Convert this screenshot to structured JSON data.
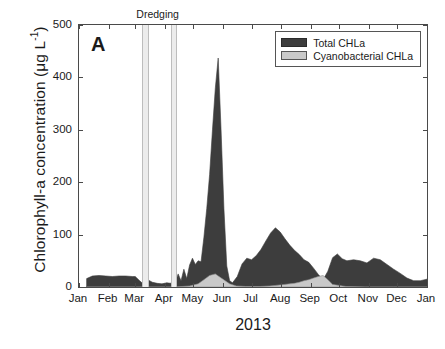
{
  "panel": {
    "letter": "A"
  },
  "annotation": {
    "dredging_label": "Dredging"
  },
  "legend": {
    "items": [
      {
        "label": "Total CHLa",
        "color": "#3d3d3d"
      },
      {
        "label": "Cyanobacterial CHLa",
        "color": "#c9c9c9"
      }
    ]
  },
  "axes": {
    "ylabel_main": "Chlorophyll-a concentration (μg L",
    "ylabel_sup": "-1",
    "ylabel_close": ")",
    "xlabel": "2013",
    "yticks": [
      "0",
      "100",
      "200",
      "300",
      "400",
      "500"
    ],
    "xticks": [
      "Jan",
      "Feb",
      "Mar",
      "Apr",
      "May",
      "Jun",
      "Jul",
      "Aug",
      "Sep",
      "Oct",
      "Nov",
      "Dec",
      "Jan"
    ]
  },
  "chart_data": {
    "type": "area",
    "title": "",
    "xlabel": "2013",
    "ylabel": "Chlorophyll-a concentration (µg L-1)",
    "ylim": [
      0,
      500
    ],
    "xlim": [
      0,
      365
    ],
    "grid": false,
    "legend_position": "top-right",
    "x_tick_labels": [
      "Jan",
      "Feb",
      "Mar",
      "Apr",
      "May",
      "Jun",
      "Jul",
      "Aug",
      "Sep",
      "Oct",
      "Nov",
      "Dec",
      "Jan"
    ],
    "x_tick_days": [
      0,
      31,
      59,
      90,
      120,
      151,
      181,
      212,
      243,
      273,
      304,
      334,
      365
    ],
    "annotations": [
      {
        "text": "Dredging",
        "type": "shaded-bands",
        "band_days": [
          [
            66,
            71
          ],
          [
            96,
            101
          ]
        ]
      },
      {
        "text": "A",
        "type": "panel-label"
      }
    ],
    "series": [
      {
        "name": "Total CHLa",
        "color": "#3d3d3d",
        "x_days": [
          8,
          14,
          21,
          28,
          35,
          42,
          49,
          56,
          59,
          63,
          66,
          68,
          70,
          73,
          77,
          82,
          87,
          92,
          96,
          99,
          101,
          104,
          107,
          110,
          113,
          116,
          119,
          122,
          125,
          128,
          131,
          134,
          137,
          140,
          143,
          146,
          149,
          152,
          155,
          158,
          161,
          166,
          171,
          176,
          181,
          186,
          191,
          196,
          201,
          206,
          211,
          216,
          221,
          226,
          231,
          236,
          241,
          246,
          251,
          256,
          261,
          266,
          271,
          276,
          281,
          288,
          295,
          302,
          309,
          316,
          323,
          330,
          337,
          344,
          351,
          358,
          365
        ],
        "y_values": [
          16,
          21,
          22,
          21,
          20,
          21,
          21,
          20,
          20,
          13,
          8,
          12,
          28,
          13,
          9,
          7,
          6,
          8,
          7,
          13,
          9,
          25,
          12,
          34,
          16,
          42,
          55,
          43,
          50,
          48,
          95,
          150,
          215,
          300,
          380,
          437,
          300,
          150,
          40,
          12,
          8,
          20,
          44,
          55,
          52,
          60,
          72,
          88,
          103,
          113,
          105,
          92,
          80,
          70,
          62,
          52,
          47,
          36,
          24,
          14,
          30,
          56,
          63,
          54,
          50,
          52,
          50,
          46,
          55,
          52,
          43,
          34,
          26,
          17,
          12,
          12,
          15,
          20,
          28,
          38
        ]
      },
      {
        "name": "Cyanobacterial CHLa",
        "color": "#c9c9c9",
        "x_days": [
          8,
          60,
          100,
          116,
          125,
          131,
          137,
          143,
          150,
          158,
          165,
          175,
          190,
          200,
          206,
          211,
          216,
          221,
          226,
          231,
          236,
          241,
          246,
          251,
          256,
          261,
          266,
          280,
          300,
          330,
          365
        ],
        "y_values": [
          0,
          0,
          0,
          2,
          6,
          14,
          22,
          25,
          16,
          6,
          2,
          1,
          1,
          2,
          3,
          4,
          5,
          6,
          7,
          9,
          12,
          14,
          17,
          20,
          22,
          14,
          5,
          1,
          0,
          0,
          0
        ]
      }
    ],
    "peaks": [
      {
        "series": "Total CHLa",
        "approx_day": 146,
        "value": 437,
        "note": "mid-May bloom maximum"
      },
      {
        "series": "Total CHLa",
        "approx_day": 206,
        "value": 113,
        "note": "early-July secondary peak"
      },
      {
        "series": "Cyanobacterial CHLa",
        "approx_day": 143,
        "value": 25,
        "note": "May cyanobacterial bump"
      },
      {
        "series": "Cyanobacterial CHLa",
        "approx_day": 256,
        "value": 22,
        "note": "late-July/August cyanobacterial bump"
      }
    ]
  }
}
